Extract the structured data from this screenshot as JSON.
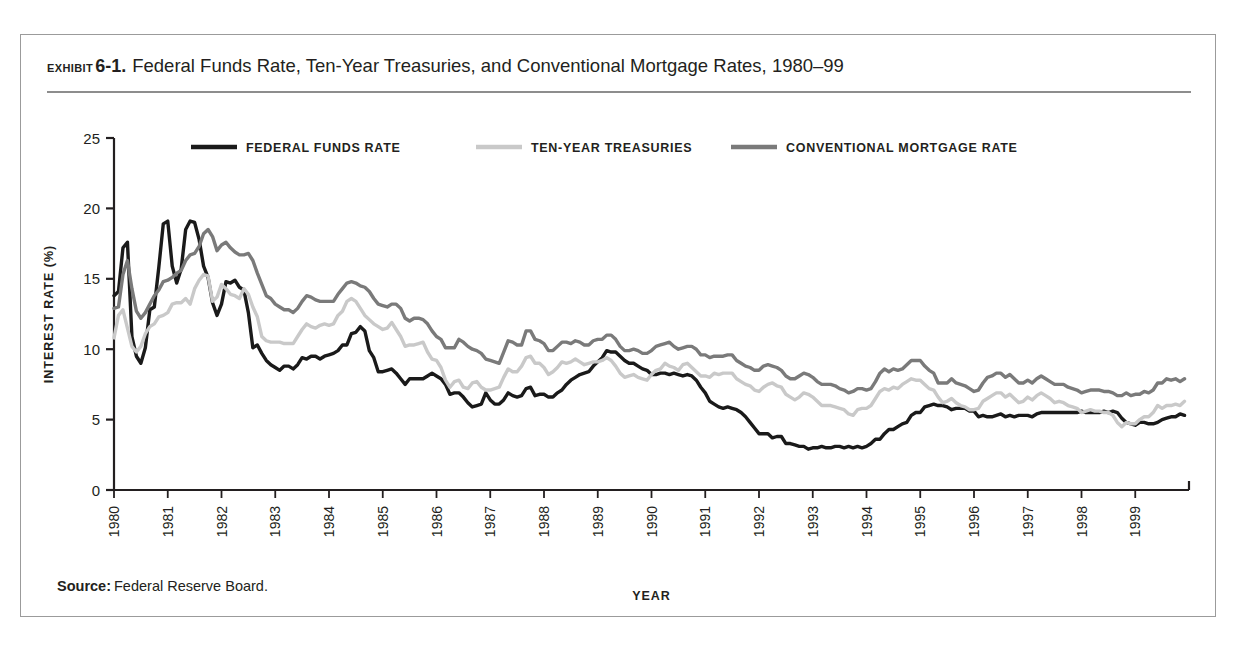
{
  "exhibit": {
    "kicker": "EXHIBIT",
    "number": "6-1.",
    "title": "Federal Funds Rate, Ten-Year Treasuries, and Conventional Mortgage Rates, 1980–99"
  },
  "source": {
    "label": "Source:",
    "text": "Federal Reserve Board."
  },
  "colors": {
    "federal_funds": "#1a1a1a",
    "ten_year": "#c9c9c9",
    "mortgage": "#7a7a7a",
    "axis": "#231f20",
    "frame": "#9b9b9b",
    "rule": "#8d8d8d"
  },
  "chart_data": {
    "type": "line",
    "title": "Federal Funds Rate, Ten-Year Treasuries, and Conventional Mortgage Rates, 1980–99",
    "xlabel": "YEAR",
    "ylabel": "INTEREST RATE (%)",
    "xlim": [
      1980,
      2000
    ],
    "ylim": [
      0,
      25
    ],
    "yticks": [
      0,
      5,
      10,
      15,
      20,
      25
    ],
    "ytick_labels": [
      "0",
      "5",
      "10",
      "15",
      "20",
      "25"
    ],
    "xticks": [
      1980,
      1981,
      1982,
      1983,
      1984,
      1985,
      1986,
      1987,
      1988,
      1989,
      1990,
      1991,
      1992,
      1993,
      1994,
      1995,
      1996,
      1997,
      1998,
      1999
    ],
    "xtick_labels": [
      "1980",
      "1981",
      "1982",
      "1983",
      "1984",
      "1985",
      "1986",
      "1987",
      "1988",
      "1989",
      "1990",
      "1991",
      "1992",
      "1993",
      "1994",
      "1995",
      "1996",
      "1997",
      "1998",
      "1999"
    ],
    "grid": false,
    "legend_position": "top-inside",
    "x_step_years": 0.08333333,
    "series": [
      {
        "name": "FEDERAL FUNDS RATE",
        "color": "#1a1a1a",
        "legend_label": "FEDERAL FUNDS RATE",
        "values": [
          13.8,
          14.1,
          17.2,
          17.6,
          10.9,
          9.5,
          9.0,
          10.1,
          12.8,
          13.0,
          15.8,
          18.9,
          19.1,
          15.9,
          14.7,
          15.7,
          18.5,
          19.1,
          19.0,
          17.8,
          15.9,
          15.1,
          13.3,
          12.4,
          13.2,
          14.8,
          14.7,
          14.9,
          14.4,
          14.2,
          12.6,
          10.1,
          10.3,
          9.7,
          9.2,
          8.9,
          8.7,
          8.5,
          8.8,
          8.8,
          8.6,
          8.9,
          9.4,
          9.3,
          9.5,
          9.5,
          9.3,
          9.5,
          9.6,
          9.7,
          9.9,
          10.3,
          10.3,
          11.1,
          11.2,
          11.6,
          11.3,
          9.9,
          9.4,
          8.4,
          8.4,
          8.5,
          8.6,
          8.3,
          7.9,
          7.5,
          7.9,
          7.9,
          7.9,
          7.9,
          8.1,
          8.3,
          8.1,
          7.9,
          7.5,
          6.8,
          6.9,
          6.9,
          6.6,
          6.2,
          5.9,
          6.0,
          6.1,
          6.9,
          6.4,
          6.1,
          6.1,
          6.4,
          6.9,
          6.7,
          6.6,
          6.7,
          7.2,
          7.3,
          6.7,
          6.8,
          6.8,
          6.6,
          6.6,
          6.9,
          7.1,
          7.5,
          7.8,
          8.0,
          8.2,
          8.3,
          8.4,
          8.8,
          9.1,
          9.4,
          9.9,
          9.8,
          9.8,
          9.5,
          9.2,
          9.0,
          9.0,
          8.8,
          8.6,
          8.5,
          8.2,
          8.2,
          8.3,
          8.3,
          8.2,
          8.3,
          8.2,
          8.1,
          8.2,
          8.1,
          7.8,
          7.3,
          6.9,
          6.3,
          6.1,
          5.9,
          5.8,
          5.9,
          5.8,
          5.7,
          5.5,
          5.2,
          4.8,
          4.4,
          4.0,
          4.0,
          4.0,
          3.7,
          3.8,
          3.8,
          3.3,
          3.3,
          3.2,
          3.1,
          3.1,
          2.9,
          3.0,
          3.0,
          3.1,
          3.0,
          3.0,
          3.1,
          3.1,
          3.0,
          3.1,
          3.0,
          3.1,
          3.0,
          3.1,
          3.3,
          3.6,
          3.6,
          4.0,
          4.3,
          4.3,
          4.5,
          4.7,
          4.8,
          5.3,
          5.5,
          5.5,
          5.9,
          6.0,
          6.1,
          6.0,
          6.0,
          5.9,
          5.7,
          5.8,
          5.8,
          5.8,
          5.6,
          5.6,
          5.2,
          5.3,
          5.2,
          5.2,
          5.3,
          5.4,
          5.2,
          5.3,
          5.2,
          5.3,
          5.3,
          5.3,
          5.2,
          5.4,
          5.5,
          5.5,
          5.5,
          5.5,
          5.5,
          5.5,
          5.5,
          5.5,
          5.5,
          5.6,
          5.5,
          5.5,
          5.5,
          5.5,
          5.6,
          5.5,
          5.6,
          5.5,
          5.1,
          4.8,
          4.7,
          4.6,
          4.8,
          4.8,
          4.7,
          4.7,
          4.8,
          5.0,
          5.1,
          5.2,
          5.2,
          5.4,
          5.3
        ]
      },
      {
        "name": "TEN-YEAR TREASURIES",
        "color": "#c9c9c9",
        "legend_label": "TEN-YEAR TREASURIES",
        "values": [
          10.8,
          12.4,
          12.8,
          11.5,
          10.2,
          9.8,
          10.2,
          11.1,
          11.6,
          11.8,
          12.3,
          12.4,
          12.6,
          13.2,
          13.3,
          13.3,
          13.6,
          13.2,
          14.3,
          14.9,
          15.3,
          15.2,
          13.4,
          13.7,
          14.6,
          14.3,
          13.9,
          13.8,
          13.6,
          14.3,
          13.9,
          13.0,
          12.3,
          10.9,
          10.6,
          10.5,
          10.5,
          10.5,
          10.4,
          10.4,
          10.4,
          10.9,
          11.4,
          11.8,
          11.6,
          11.5,
          11.7,
          11.8,
          11.7,
          11.8,
          12.4,
          12.7,
          13.4,
          13.6,
          13.4,
          12.9,
          12.4,
          12.1,
          11.8,
          11.6,
          11.4,
          11.5,
          11.9,
          11.4,
          10.9,
          10.2,
          10.3,
          10.3,
          10.4,
          10.5,
          9.8,
          9.3,
          9.2,
          8.7,
          7.8,
          7.3,
          7.7,
          7.8,
          7.3,
          7.2,
          7.6,
          7.7,
          7.3,
          7.1,
          7.1,
          7.2,
          7.3,
          8.0,
          8.6,
          8.4,
          8.4,
          8.8,
          9.4,
          9.5,
          9.0,
          9.0,
          8.7,
          8.2,
          8.4,
          8.7,
          9.1,
          9.0,
          9.1,
          9.3,
          9.1,
          8.9,
          9.0,
          9.1,
          9.1,
          9.2,
          9.4,
          9.2,
          8.8,
          8.3,
          8.0,
          8.1,
          8.2,
          8.0,
          7.9,
          7.8,
          8.2,
          8.5,
          8.6,
          9.0,
          8.8,
          8.7,
          8.5,
          8.9,
          9.0,
          8.7,
          8.4,
          8.1,
          8.1,
          8.0,
          8.3,
          8.2,
          8.3,
          8.3,
          8.3,
          7.9,
          7.7,
          7.5,
          7.4,
          7.1,
          7.0,
          7.3,
          7.5,
          7.6,
          7.4,
          7.3,
          6.8,
          6.6,
          6.4,
          6.6,
          6.9,
          6.8,
          6.6,
          6.3,
          6.0,
          6.0,
          6.0,
          5.9,
          5.8,
          5.7,
          5.4,
          5.3,
          5.7,
          5.8,
          5.8,
          6.0,
          6.5,
          7.0,
          7.2,
          7.1,
          7.3,
          7.2,
          7.5,
          7.7,
          7.9,
          7.8,
          7.8,
          7.5,
          7.2,
          7.1,
          6.6,
          6.2,
          6.3,
          6.5,
          6.2,
          6.0,
          5.9,
          5.7,
          5.7,
          5.8,
          6.3,
          6.5,
          6.7,
          6.9,
          6.9,
          6.6,
          6.8,
          6.5,
          6.2,
          6.3,
          6.6,
          6.4,
          6.7,
          6.9,
          6.7,
          6.5,
          6.2,
          6.3,
          6.2,
          6.0,
          5.9,
          5.8,
          5.5,
          5.6,
          5.7,
          5.6,
          5.6,
          5.5,
          5.5,
          5.3,
          4.8,
          4.5,
          4.8,
          4.7,
          4.7,
          5.0,
          5.2,
          5.2,
          5.5,
          6.0,
          5.8,
          6.0,
          6.0,
          6.1,
          6.0,
          6.3
        ]
      },
      {
        "name": "CONVENTIONAL MORTGAGE RATE",
        "color": "#7a7a7a",
        "legend_label": "CONVENTIONAL MORTGAGE RATE",
        "values": [
          12.9,
          13.0,
          15.3,
          16.3,
          14.3,
          12.7,
          12.2,
          12.6,
          13.2,
          13.8,
          14.2,
          14.8,
          14.9,
          15.1,
          15.4,
          15.6,
          16.3,
          16.7,
          16.8,
          17.3,
          18.2,
          18.5,
          18.0,
          17.0,
          17.4,
          17.6,
          17.2,
          16.9,
          16.7,
          16.7,
          16.8,
          16.3,
          15.4,
          14.6,
          13.8,
          13.6,
          13.2,
          13.0,
          12.8,
          12.8,
          12.6,
          12.9,
          13.4,
          13.8,
          13.7,
          13.5,
          13.4,
          13.4,
          13.4,
          13.4,
          13.9,
          14.3,
          14.7,
          14.8,
          14.7,
          14.5,
          14.4,
          14.1,
          13.6,
          13.2,
          13.1,
          13.0,
          13.2,
          13.2,
          12.9,
          12.2,
          12.0,
          12.2,
          12.2,
          12.1,
          11.8,
          11.3,
          10.9,
          10.7,
          10.1,
          10.1,
          10.1,
          10.7,
          10.5,
          10.2,
          10.0,
          9.9,
          9.7,
          9.3,
          9.2,
          9.1,
          9.0,
          9.8,
          10.6,
          10.5,
          10.3,
          10.3,
          11.3,
          11.3,
          10.7,
          10.6,
          10.4,
          9.9,
          9.9,
          10.2,
          10.5,
          10.5,
          10.4,
          10.6,
          10.5,
          10.3,
          10.3,
          10.6,
          10.7,
          10.7,
          11.0,
          11.0,
          10.7,
          10.2,
          9.9,
          9.9,
          10.0,
          9.9,
          9.7,
          9.7,
          9.9,
          10.2,
          10.3,
          10.4,
          10.5,
          10.2,
          10.0,
          10.1,
          10.2,
          10.2,
          10.0,
          9.6,
          9.6,
          9.4,
          9.5,
          9.5,
          9.5,
          9.6,
          9.6,
          9.2,
          9.0,
          8.8,
          8.7,
          8.5,
          8.5,
          8.8,
          8.9,
          8.8,
          8.7,
          8.5,
          8.1,
          7.9,
          7.9,
          8.1,
          8.3,
          8.2,
          8.0,
          7.7,
          7.5,
          7.5,
          7.5,
          7.4,
          7.2,
          7.1,
          6.9,
          7.0,
          7.2,
          7.2,
          7.1,
          7.2,
          7.7,
          8.3,
          8.6,
          8.4,
          8.6,
          8.5,
          8.6,
          8.9,
          9.2,
          9.2,
          9.2,
          8.8,
          8.5,
          8.3,
          7.6,
          7.6,
          7.6,
          7.9,
          7.6,
          7.5,
          7.4,
          7.2,
          7.0,
          7.1,
          7.6,
          8.0,
          8.1,
          8.3,
          8.3,
          8.0,
          8.2,
          7.9,
          7.6,
          7.6,
          7.8,
          7.6,
          7.9,
          8.1,
          7.9,
          7.7,
          7.5,
          7.5,
          7.5,
          7.3,
          7.2,
          7.1,
          6.9,
          7.0,
          7.1,
          7.1,
          7.1,
          7.0,
          7.0,
          6.9,
          6.7,
          6.7,
          6.9,
          6.7,
          6.8,
          6.8,
          7.0,
          6.9,
          7.1,
          7.6,
          7.6,
          7.9,
          7.8,
          7.9,
          7.7,
          7.9
        ]
      }
    ]
  }
}
